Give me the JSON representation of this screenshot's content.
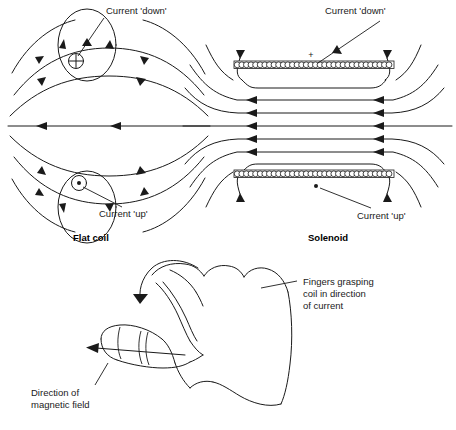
{
  "figure": {
    "background_color": "#ffffff",
    "ink_color": "#1a1a1a"
  },
  "panels": {
    "flat_coil": {
      "caption": "Flat coil",
      "label_top": "Current 'down'",
      "label_bottom": "Current 'up'",
      "symbol_into_page": "+",
      "symbol_out_of_page": "•",
      "field_direction": "leftward along central axis"
    },
    "solenoid": {
      "caption": "Solenoid",
      "label_top": "Current 'down'",
      "label_bottom": "Current 'up'",
      "symbol_into_page": "+",
      "symbol_out_of_page": "•",
      "field_direction": "leftward along central axis",
      "turns_top": 34,
      "turns_bottom": 34
    },
    "hand": {
      "label_fingers": "Fingers grasping\ncoil in direction\nof current",
      "label_fingers_line1": "Fingers grasping",
      "label_fingers_line2": "coil in direction",
      "label_fingers_line3": "of current",
      "label_thumb_line1": "Direction of",
      "label_thumb_line2": "magnetic field",
      "thumb_direction": "left",
      "curl_direction": "counter-clockwise over knuckles"
    }
  }
}
